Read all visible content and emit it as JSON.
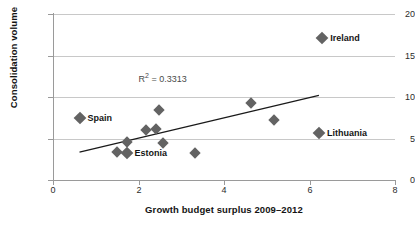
{
  "chart_data": {
    "type": "scatter",
    "title": "",
    "xlabel": "Growth budget surplus 2009–2012",
    "ylabel": "Consolidation volume",
    "xlim": [
      0,
      8
    ],
    "ylim": [
      0,
      20
    ],
    "xticks": [
      0,
      2,
      4,
      6,
      8
    ],
    "yticks": [
      0,
      5,
      10,
      15,
      20
    ],
    "xtick_labels": [
      "0",
      "2",
      "4",
      "6",
      "8"
    ],
    "ytick_labels": [
      "0",
      "5",
      "10",
      "15",
      "20"
    ],
    "grid": "horizontal",
    "legend": "none",
    "annotations": [
      {
        "text": "R² = 0.3313",
        "x": 2.0,
        "y": 12.4
      }
    ],
    "marker_color": "#636363",
    "marker_shape": "diamond",
    "trendline": {
      "type": "linear",
      "x_start": 0.62,
      "y_start": 3.35,
      "x_end": 6.22,
      "y_end": 10.2,
      "color": "#1a1a1a",
      "r_squared": 0.3313
    },
    "points": [
      {
        "x": 0.62,
        "y": 7.45,
        "label": "Spain"
      },
      {
        "x": 1.5,
        "y": 3.35,
        "label": ""
      },
      {
        "x": 1.72,
        "y": 3.22,
        "label": "Estonia"
      },
      {
        "x": 1.74,
        "y": 4.55,
        "label": ""
      },
      {
        "x": 2.18,
        "y": 6.05,
        "label": ""
      },
      {
        "x": 2.42,
        "y": 6.1,
        "label": ""
      },
      {
        "x": 2.48,
        "y": 8.45,
        "label": ""
      },
      {
        "x": 2.58,
        "y": 4.45,
        "label": ""
      },
      {
        "x": 3.32,
        "y": 3.25,
        "label": ""
      },
      {
        "x": 4.62,
        "y": 9.3,
        "label": ""
      },
      {
        "x": 5.18,
        "y": 7.25,
        "label": ""
      },
      {
        "x": 6.22,
        "y": 5.7,
        "label": "Lithuania"
      },
      {
        "x": 6.3,
        "y": 17.1,
        "label": "Ireland"
      }
    ]
  },
  "labels": {
    "spain": "Spain",
    "estonia": "Estonia",
    "ireland": "Ireland",
    "lithuania": "Lithuania",
    "r2": "R² = 0.3313",
    "xaxis_title": "Growth budget surplus 2009–2012",
    "yaxis_title": "Consolidation volume"
  }
}
